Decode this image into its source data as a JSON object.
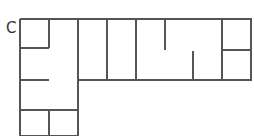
{
  "diagram": {
    "label": "C",
    "type": "floor-plan",
    "stroke_color": "#555555",
    "stroke_width": 2,
    "outline": [
      [
        20,
        19
      ],
      [
        251,
        19
      ],
      [
        251,
        80
      ],
      [
        78,
        80
      ],
      [
        78,
        136
      ],
      [
        20,
        136
      ],
      [
        20,
        19
      ]
    ],
    "walls": [
      {
        "id": "w1",
        "x1": 49,
        "y1": 19,
        "x2": 49,
        "y2": 48
      },
      {
        "id": "w2",
        "x1": 20,
        "y1": 48,
        "x2": 49,
        "y2": 48
      },
      {
        "id": "w3",
        "x1": 78,
        "y1": 19,
        "x2": 78,
        "y2": 80
      },
      {
        "id": "w4",
        "x1": 107,
        "y1": 19,
        "x2": 107,
        "y2": 80
      },
      {
        "id": "w5",
        "x1": 136,
        "y1": 19,
        "x2": 136,
        "y2": 80
      },
      {
        "id": "w6",
        "x1": 165,
        "y1": 19,
        "x2": 165,
        "y2": 50
      },
      {
        "id": "w7",
        "x1": 193,
        "y1": 51,
        "x2": 193,
        "y2": 80
      },
      {
        "id": "w8",
        "x1": 222,
        "y1": 19,
        "x2": 222,
        "y2": 80
      },
      {
        "id": "w9",
        "x1": 222,
        "y1": 50,
        "x2": 251,
        "y2": 50
      },
      {
        "id": "w10",
        "x1": 20,
        "y1": 80,
        "x2": 49,
        "y2": 80
      },
      {
        "id": "w11",
        "x1": 20,
        "y1": 110,
        "x2": 78,
        "y2": 110
      },
      {
        "id": "w12",
        "x1": 49,
        "y1": 110,
        "x2": 49,
        "y2": 136
      }
    ]
  }
}
